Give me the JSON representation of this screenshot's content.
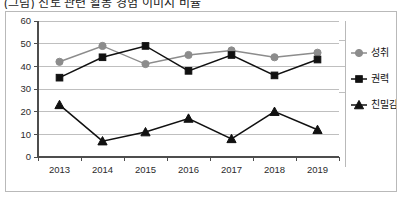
{
  "title": "(그림) 진로 관련 활동 경험 이미지 비율",
  "chart_data": {
    "type": "line",
    "title": "(그림) 진로 관련 활동 경험 이미지 비율",
    "xlabel": "",
    "ylabel": "",
    "categories": [
      "2013",
      "2014",
      "2015",
      "2016",
      "2017",
      "2018",
      "2019"
    ],
    "ylim": [
      0,
      60
    ],
    "yticks": [
      0,
      10,
      20,
      30,
      40,
      50,
      60
    ],
    "grid": true,
    "legend_position": "right",
    "series": [
      {
        "name": "성취",
        "marker": "circle",
        "color": "#8c8c8c",
        "values": [
          42,
          49,
          41,
          45,
          47,
          44,
          46
        ]
      },
      {
        "name": "권력",
        "marker": "square",
        "color": "#111111",
        "values": [
          35,
          44,
          49,
          38,
          45,
          36,
          43
        ]
      },
      {
        "name": "친밀감",
        "marker": "triangle",
        "color": "#111111",
        "values": [
          23,
          7,
          11,
          17,
          8,
          20,
          12
        ]
      }
    ]
  },
  "colors": {
    "frame": "#b9b9b9",
    "grid": "#bfbfbf",
    "axis": "#4d4d4d",
    "series_grey": "#8c8c8c",
    "series_black": "#111111"
  }
}
